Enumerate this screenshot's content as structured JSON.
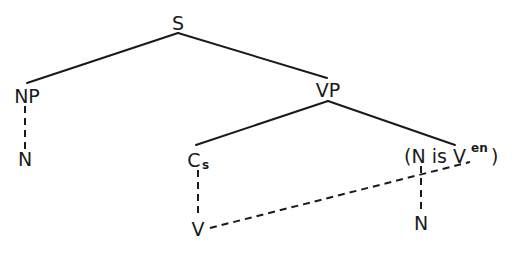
{
  "diagram": {
    "type": "syntax-tree",
    "nodes": {
      "s": "S",
      "np": "NP",
      "np_n": "N",
      "vp": "VP",
      "cs_main": "C",
      "cs_sub": "s",
      "cs_v": "V",
      "passive_open": "(N is V",
      "passive_sup": "en",
      "passive_close": ")",
      "passive_n": "N"
    },
    "edges": [
      {
        "from": "S",
        "to": "NP",
        "style": "solid"
      },
      {
        "from": "S",
        "to": "VP",
        "style": "solid"
      },
      {
        "from": "NP",
        "to": "N",
        "style": "dashed"
      },
      {
        "from": "VP",
        "to": "Cs",
        "style": "solid"
      },
      {
        "from": "VP",
        "to": "(N is V^en)",
        "style": "solid"
      },
      {
        "from": "Cs",
        "to": "V",
        "style": "dashed"
      },
      {
        "from": "V",
        "to": "V^en",
        "style": "dashed"
      },
      {
        "from": "N (in N is V^en)",
        "to": "N",
        "style": "dashed"
      }
    ]
  }
}
